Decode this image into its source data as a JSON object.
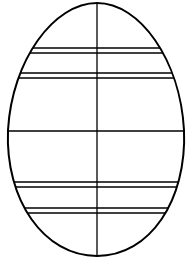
{
  "figure": {
    "background": "#ffffff",
    "stroke": "#000000",
    "vertical_line_x": 97,
    "horizontal_lines_y": [
      48,
      53,
      73,
      78,
      131,
      182,
      187,
      208,
      213
    ]
  }
}
